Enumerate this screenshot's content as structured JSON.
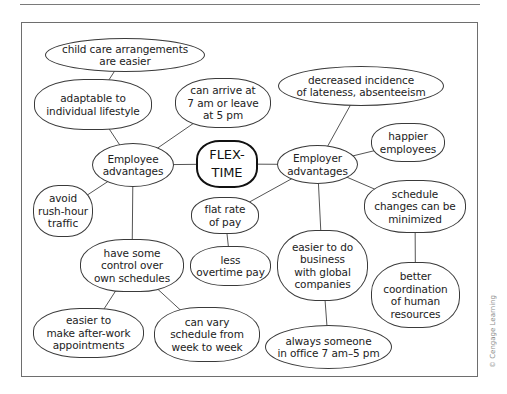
{
  "diagram": {
    "type": "mind-map",
    "center": {
      "id": "flex",
      "label": "FLEX-\nTIME"
    },
    "nodes": [
      {
        "id": "flex",
        "label": "FLEX-\nTIME",
        "x": 196,
        "y": 140,
        "w": 62,
        "h": 48,
        "style": "center"
      },
      {
        "id": "employee",
        "label": "Employee\nadvantages",
        "x": 92,
        "y": 143,
        "w": 82,
        "h": 44,
        "style": "oval"
      },
      {
        "id": "employer",
        "label": "Employer\nadvantages",
        "x": 277,
        "y": 145,
        "w": 81,
        "h": 39,
        "style": "oval"
      },
      {
        "id": "childcare",
        "label": "child care arrangements\nare easier",
        "x": 45,
        "y": 38,
        "w": 160,
        "h": 34,
        "style": "oval"
      },
      {
        "id": "adaptable",
        "label": "adaptable to\nindividual lifestyle",
        "x": 34,
        "y": 79,
        "w": 118,
        "h": 51,
        "style": "blob"
      },
      {
        "id": "arrive",
        "label": "can arrive at\n7 am or leave\nat 5 pm",
        "x": 175,
        "y": 78,
        "w": 96,
        "h": 50,
        "style": "blob"
      },
      {
        "id": "rushhour",
        "label": "avoid\nrush-hour\ntraffic",
        "x": 33,
        "y": 185,
        "w": 60,
        "h": 52,
        "style": "blob"
      },
      {
        "id": "control",
        "label": "have some\ncontrol over\nown schedules",
        "x": 80,
        "y": 239,
        "w": 104,
        "h": 53,
        "style": "blob"
      },
      {
        "id": "afterwork",
        "label": "easier to\nmake after-work\nappointments",
        "x": 33,
        "y": 308,
        "w": 111,
        "h": 50,
        "style": "blob"
      },
      {
        "id": "vary",
        "label": "can vary\nschedule from\nweek to week",
        "x": 154,
        "y": 307,
        "w": 106,
        "h": 55,
        "style": "blob"
      },
      {
        "id": "lateness",
        "label": "decreased incidence\nof lateness, absenteeism",
        "x": 278,
        "y": 66,
        "w": 166,
        "h": 40,
        "style": "oval"
      },
      {
        "id": "happier",
        "label": "happier\nemployees",
        "x": 371,
        "y": 123,
        "w": 74,
        "h": 39,
        "style": "blob"
      },
      {
        "id": "schedchg",
        "label": "schedule\nchanges can be\nminimized",
        "x": 364,
        "y": 180,
        "w": 102,
        "h": 53,
        "style": "blob"
      },
      {
        "id": "flatrate",
        "label": "flat rate\nof pay",
        "x": 191,
        "y": 197,
        "w": 68,
        "h": 37,
        "style": "blob"
      },
      {
        "id": "overtime",
        "label": "less\novertime pay",
        "x": 190,
        "y": 246,
        "w": 81,
        "h": 40,
        "style": "blob"
      },
      {
        "id": "global",
        "label": "easier to do\nbusiness\nwith global\ncompanies",
        "x": 277,
        "y": 230,
        "w": 91,
        "h": 71,
        "style": "blob"
      },
      {
        "id": "coord",
        "label": "better\ncoordination\nof human\nresources",
        "x": 371,
        "y": 262,
        "w": 89,
        "h": 66,
        "style": "blob"
      },
      {
        "id": "always",
        "label": "always someone\nin office 7 am–5 pm",
        "x": 265,
        "y": 325,
        "w": 127,
        "h": 44,
        "style": "oval"
      }
    ],
    "edges": [
      [
        "flex",
        "employee"
      ],
      [
        "flex",
        "employer"
      ],
      [
        "employee",
        "adaptable"
      ],
      [
        "adaptable",
        "childcare"
      ],
      [
        "employee",
        "arrive"
      ],
      [
        "employee",
        "rushhour"
      ],
      [
        "employee",
        "control"
      ],
      [
        "control",
        "afterwork"
      ],
      [
        "control",
        "vary"
      ],
      [
        "employer",
        "lateness"
      ],
      [
        "employer",
        "happier"
      ],
      [
        "employer",
        "schedchg"
      ],
      [
        "employer",
        "flatrate"
      ],
      [
        "flatrate",
        "overtime"
      ],
      [
        "employer",
        "global"
      ],
      [
        "global",
        "always"
      ],
      [
        "schedchg",
        "coord"
      ]
    ]
  },
  "credit": "© Cengage Learning",
  "colors": {
    "line": "#555555",
    "border": "#3a3a3a",
    "frame": "#6e6e6e",
    "text": "#222222"
  }
}
